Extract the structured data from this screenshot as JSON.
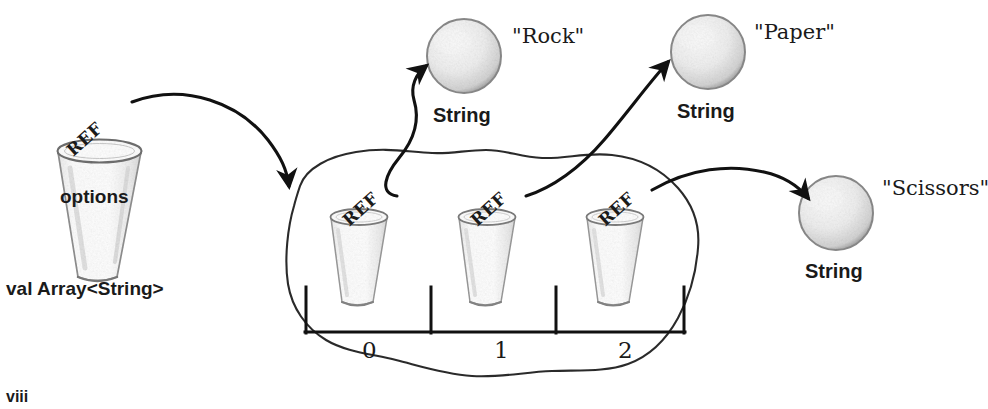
{
  "figure": {
    "kind": "object-reference-diagram",
    "page_number": "viii",
    "ink_color": "#1a1a1a",
    "sketch_color": "#8d8d8d",
    "background": "#ffffff"
  },
  "variable": {
    "name": "options",
    "ref_label": "REF",
    "declaration": "val Array<String>",
    "icon": "cup-icon"
  },
  "array": {
    "container_icon": "blob-shape",
    "slots": [
      {
        "index_label": "0",
        "ref_label": "REF",
        "icon": "cup-icon"
      },
      {
        "index_label": "1",
        "ref_label": "REF",
        "icon": "cup-icon"
      },
      {
        "index_label": "2",
        "ref_label": "REF",
        "icon": "cup-icon"
      }
    ]
  },
  "objects": [
    {
      "type_label": "String",
      "value_label": "\"Rock\"",
      "icon": "sphere-icon"
    },
    {
      "type_label": "String",
      "value_label": "\"Paper\"",
      "icon": "sphere-icon"
    },
    {
      "type_label": "String",
      "value_label": "\"Scissors\"",
      "icon": "sphere-icon"
    }
  ],
  "arrows": [
    {
      "from": "options",
      "to": "array-blob",
      "icon": "curved-arrow-icon"
    },
    {
      "from": "slot-0",
      "to": "string-rock",
      "icon": "curved-arrow-icon"
    },
    {
      "from": "slot-1",
      "to": "string-paper",
      "icon": "curved-arrow-icon"
    },
    {
      "from": "slot-2",
      "to": "string-scissors",
      "icon": "curved-arrow-icon"
    }
  ]
}
